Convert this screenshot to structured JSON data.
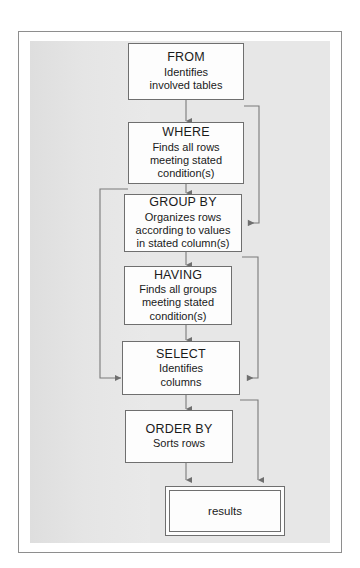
{
  "figure": {
    "frame_color": "#8e8e8e",
    "panel_color": "#e7e7e7",
    "node_fill": "#fdfdfd",
    "node_border": "#6f6f6f",
    "connector_color": "#7a7a7a",
    "text_color": "#1a1a1a"
  },
  "nodes": [
    {
      "id": "from",
      "keyword": "FROM",
      "desc_lines": [
        "Identifies",
        "involved tables"
      ]
    },
    {
      "id": "where",
      "keyword": "WHERE",
      "desc_lines": [
        "Finds all rows",
        "meeting stated",
        "condition(s)"
      ]
    },
    {
      "id": "group_by",
      "keyword": "GROUP BY",
      "desc_lines": [
        "Organizes rows",
        "according to values",
        "in stated column(s)"
      ]
    },
    {
      "id": "having",
      "keyword": "HAVING",
      "desc_lines": [
        "Finds all groups",
        "meeting stated",
        "condition(s)"
      ]
    },
    {
      "id": "select",
      "keyword": "SELECT",
      "desc_lines": [
        "Identifies",
        "columns"
      ]
    },
    {
      "id": "order_by",
      "keyword": "ORDER BY",
      "desc_lines": [
        "Sorts rows"
      ]
    }
  ],
  "terminal": {
    "id": "results",
    "label": "results"
  },
  "connectors": [
    {
      "id": "from-to-where",
      "from": "from",
      "to": "where",
      "kind": "straight-down"
    },
    {
      "id": "where-to-group-by",
      "from": "where",
      "to": "group_by",
      "kind": "straight-down"
    },
    {
      "id": "from-bypass-to-group-by",
      "from": "from",
      "to": "group_by",
      "kind": "right-bypass"
    },
    {
      "id": "group-by-to-having",
      "from": "group_by",
      "to": "having",
      "kind": "straight-down"
    },
    {
      "id": "having-to-select",
      "from": "having",
      "to": "select",
      "kind": "straight-down"
    },
    {
      "id": "where-bypass-to-select",
      "from": "where",
      "to": "select",
      "kind": "left-bypass"
    },
    {
      "id": "group-by-bypass-to-select",
      "from": "group_by",
      "to": "select",
      "kind": "right-bypass"
    },
    {
      "id": "select-to-order-by",
      "from": "select",
      "to": "order_by",
      "kind": "straight-down"
    },
    {
      "id": "order-by-to-results",
      "from": "order_by",
      "to": "results",
      "kind": "straight-down"
    },
    {
      "id": "select-bypass-to-results",
      "from": "select",
      "to": "results",
      "kind": "right-bypass"
    }
  ]
}
